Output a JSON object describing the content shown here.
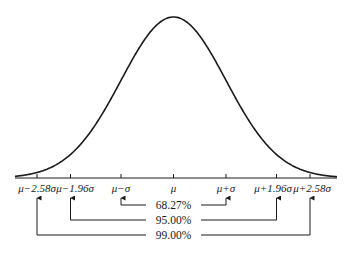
{
  "chart_data": {
    "type": "line",
    "title": "",
    "xlabel": "",
    "ylabel": "",
    "x_ticks": [
      "μ−2.58σ",
      "μ−1.96σ",
      "μ−σ",
      "μ",
      "μ+σ",
      "μ+1.96σ",
      "μ+2.58σ"
    ],
    "x_tick_values": [
      -2.58,
      -1.96,
      -1,
      0,
      1,
      1.96,
      2.58
    ],
    "intervals": [
      {
        "label": "68.27%",
        "from": "μ−σ",
        "to": "μ+σ",
        "k": 1.0
      },
      {
        "label": "95.00%",
        "from": "μ−1.96σ",
        "to": "μ+1.96σ",
        "k": 1.96
      },
      {
        "label": "99.00%",
        "from": "μ−2.58σ",
        "to": "μ+2.58σ",
        "k": 2.58
      }
    ],
    "grid": false,
    "legend": "none"
  },
  "ticks": [
    {
      "label": "μ−2.58σ"
    },
    {
      "label": "μ−1.96σ"
    },
    {
      "label": "μ−σ"
    },
    {
      "label": "μ"
    },
    {
      "label": "μ+σ"
    },
    {
      "label": "μ+1.96σ"
    },
    {
      "label": "μ+2.58σ"
    }
  ],
  "intervals": [
    {
      "label": "68.27%"
    },
    {
      "label": "95.00%"
    },
    {
      "label": "99.00%"
    }
  ],
  "colors": {
    "ink": "#1a1a1a",
    "background": "#ffffff"
  }
}
